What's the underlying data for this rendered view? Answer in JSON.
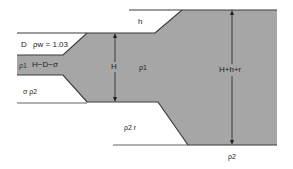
{
  "figure": {
    "type": "isostasy cross-section",
    "colors": {
      "crust_fill": "#a6a6a6",
      "line": "#3a3a3a",
      "background": "#ffffff"
    },
    "labels": {
      "water_depth": "D",
      "water_density": "ρw = 1.03",
      "thin_crust_density": "ρ1",
      "thin_crust_thickness": "H−D−σ",
      "mantle_left": "σ  ρ2",
      "elevation": "h",
      "thick_crust_height": "H",
      "thick_crust_density": "ρ1",
      "root": "ρ2   r",
      "total_thickness": "H+h+r",
      "mantle_bottom": "ρ2"
    }
  }
}
